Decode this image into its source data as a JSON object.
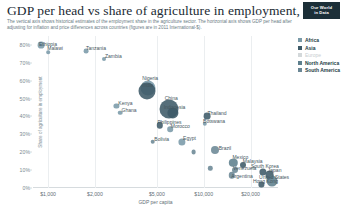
{
  "header": {
    "title": "GDP per head vs share of agriculture in employment, 2005",
    "subtitle": "The vertical axis shows historical estimates of the employment share in the agriculture sector. The horizontal axis shows GDP per head after adjusting for inflation and price differences across countries (figures are in 2011 International-$).",
    "logo_line1": "Our World",
    "logo_line2": "in Data"
  },
  "legend": {
    "items": [
      {
        "label": "Africa",
        "color": "#7a9aa8",
        "muted": false
      },
      {
        "label": "Asia",
        "color": "#3d5a68",
        "muted": false
      },
      {
        "label": "Europe",
        "color": "#d3d8da",
        "muted": true
      },
      {
        "label": "North America",
        "color": "#5d7f8d",
        "muted": false
      },
      {
        "label": "South America",
        "color": "#6b8795",
        "muted": false
      }
    ]
  },
  "chart_data": {
    "type": "scatter",
    "title": "GDP per head vs share of agriculture in employment, 2005",
    "xlabel": "GDP per capita",
    "ylabel": "Share of agriculture in employment",
    "xscale": "log",
    "xlim": [
      800,
      30000
    ],
    "ylim": [
      0,
      85
    ],
    "grid": "vertical",
    "legend_position": "top-right",
    "xticks": [
      {
        "value": 1000,
        "label": "$1,000"
      },
      {
        "value": 2000,
        "label": "$2,000"
      },
      {
        "value": 5000,
        "label": "$5,000"
      },
      {
        "value": 10000,
        "label": "$10,000"
      },
      {
        "value": 20000,
        "label": "$20,000"
      }
    ],
    "yticks": [
      {
        "value": 0,
        "label": "0%"
      },
      {
        "value": 10,
        "label": "10%"
      },
      {
        "value": 20,
        "label": "20%"
      },
      {
        "value": 30,
        "label": "30%"
      },
      {
        "value": 40,
        "label": "40%"
      },
      {
        "value": 50,
        "label": "50%"
      },
      {
        "value": 60,
        "label": "60%"
      },
      {
        "value": 70,
        "label": "70%"
      },
      {
        "value": 80,
        "label": "80%"
      }
    ],
    "points": [
      {
        "name": "Ethiopia",
        "x": 900,
        "y": 80,
        "r": 3.4,
        "continent": "Africa",
        "color": "#7a9aa8",
        "label_dx": 7,
        "label_dy": -1
      },
      {
        "name": "Malawi",
        "x": 1000,
        "y": 76,
        "r": 1.8,
        "continent": "Africa",
        "color": "#7a9aa8",
        "label_dx": 7,
        "label_dy": -4
      },
      {
        "name": "Tanzania",
        "x": 1750,
        "y": 76.5,
        "r": 2.4,
        "continent": "Africa",
        "color": "#7a9aa8",
        "label_dx": 10,
        "label_dy": -3
      },
      {
        "name": "Zambia",
        "x": 2300,
        "y": 72,
        "r": 2.0,
        "continent": "Africa",
        "color": "#7a9aa8",
        "label_dx": 9,
        "label_dy": -3
      },
      {
        "name": "Nigeria",
        "x": 4400,
        "y": 56,
        "r": 7.5,
        "continent": "Africa",
        "color": "#7a9aa8",
        "label_dx": 2,
        "label_dy": -10
      },
      {
        "name": "India",
        "x": 4300,
        "y": 54,
        "r": 8.5,
        "continent": "Asia",
        "color": "#3d5a68",
        "label_dx": 1,
        "label_dy": -6
      },
      {
        "name": "Kenya",
        "x": 2750,
        "y": 46,
        "r": 2.6,
        "continent": "Africa",
        "color": "#7a9aa8",
        "label_dx": 9,
        "label_dy": -3
      },
      {
        "name": "Ghana",
        "x": 2900,
        "y": 42,
        "r": 2.3,
        "continent": "Africa",
        "color": "#7a9aa8",
        "label_dx": 9,
        "label_dy": -3
      },
      {
        "name": "China",
        "x": 6000,
        "y": 44,
        "r": 9.5,
        "continent": "Asia",
        "color": "#3d5a68",
        "label_dx": 2,
        "label_dy": -11
      },
      {
        "name": "Indonesia",
        "x": 6300,
        "y": 42,
        "r": 5.6,
        "continent": "Asia",
        "color": "#3d5a68",
        "label_dx": 2,
        "label_dy": -6
      },
      {
        "name": "Philippines",
        "x": 5200,
        "y": 35,
        "r": 3.2,
        "continent": "Asia",
        "color": "#3d5a68",
        "label_dx": 10,
        "label_dy": -3
      },
      {
        "name": "Morocco",
        "x": 6100,
        "y": 33,
        "r": 2.8,
        "continent": "Africa",
        "color": "#7a9aa8",
        "label_dx": 10,
        "label_dy": -3
      },
      {
        "name": "Thailand",
        "x": 10500,
        "y": 40,
        "r": 3.4,
        "continent": "Asia",
        "color": "#3d5a68",
        "label_dx": 10,
        "label_dy": -3
      },
      {
        "name": "Botswana",
        "x": 10200,
        "y": 36,
        "r": 2.2,
        "continent": "Africa",
        "color": "#7a9aa8",
        "label_dx": 9,
        "label_dy": -3
      },
      {
        "name": "Bolivia",
        "x": 4700,
        "y": 26,
        "r": 2.3,
        "continent": "South America",
        "color": "#6b8795",
        "label_dx": 9,
        "label_dy": -3
      },
      {
        "name": "Egypt",
        "x": 7200,
        "y": 26,
        "r": 3.6,
        "continent": "Africa",
        "color": "#7a9aa8",
        "label_dx": 8,
        "label_dy": -4
      },
      {
        "name": "Brazil",
        "x": 11800,
        "y": 21,
        "r": 4.0,
        "continent": "South America",
        "color": "#6b8795",
        "label_dx": 10,
        "label_dy": -2
      },
      {
        "name": "",
        "x": 8600,
        "y": 20,
        "r": 2.4,
        "continent": "South America",
        "color": "#6b8795",
        "label_dx": 0,
        "label_dy": 0
      },
      {
        "name": "Mexico",
        "x": 15500,
        "y": 14,
        "r": 4.2,
        "continent": "North America",
        "color": "#5d7f8d",
        "label_dx": 7,
        "label_dy": -6
      },
      {
        "name": "Malaysia",
        "x": 17800,
        "y": 13,
        "r": 3.0,
        "continent": "Asia",
        "color": "#3d5a68",
        "label_dx": 10,
        "label_dy": -4
      },
      {
        "name": "Venezuela",
        "x": 15800,
        "y": 10,
        "r": 3.0,
        "continent": "South America",
        "color": "#6b8795",
        "label_dx": 10,
        "label_dy": -2
      },
      {
        "name": "Argentina",
        "x": 15200,
        "y": 7,
        "r": 3.2,
        "continent": "South America",
        "color": "#6b8795",
        "label_dx": 10,
        "label_dy": 1
      },
      {
        "name": "",
        "x": 11000,
        "y": 11,
        "r": 2.2,
        "continent": "South America",
        "color": "#6b8795",
        "label_dx": 0,
        "label_dy": 0
      },
      {
        "name": "South Korea",
        "x": 24000,
        "y": 9,
        "r": 3.6,
        "continent": "Asia",
        "color": "#3d5a68",
        "label_dx": 2,
        "label_dy": -6
      },
      {
        "name": "Japan",
        "x": 26500,
        "y": 7,
        "r": 4.4,
        "continent": "Asia",
        "color": "#3d5a68",
        "label_dx": 5,
        "label_dy": -5
      },
      {
        "name": "United States",
        "x": 27500,
        "y": 4,
        "r": 5.5,
        "continent": "North America",
        "color": "#5d7f8d",
        "label_dx": 2,
        "label_dy": -4
      },
      {
        "name": "Hong Kong",
        "x": 23500,
        "y": 2,
        "r": 2.6,
        "continent": "Asia",
        "color": "#3d5a68",
        "label_dx": 4,
        "label_dy": -3
      }
    ]
  }
}
